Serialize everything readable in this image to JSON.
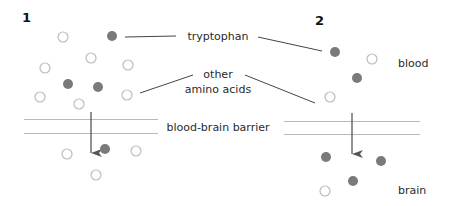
{
  "panels": [
    {
      "number": "1"
    },
    {
      "number": "2"
    }
  ],
  "labels": {
    "tryptophan": "tryptophan",
    "other_line1": "other",
    "other_line2": "amino acids",
    "barrier": "blood-brain barrier",
    "blood": "blood",
    "brain": "brain"
  },
  "colors": {
    "filled_circle": "#7a7a7a",
    "hollow_circle_stroke": "#bdbdbd",
    "barrier_line": "#b8b8b8",
    "arrow": "#555555",
    "leader_line": "#444444"
  },
  "legend": {
    "filled_circle": "tryptophan",
    "hollow_circle": "other amino acids"
  },
  "molecules": {
    "panel1_blood": [
      {
        "x": 63,
        "y": 37,
        "type": "other"
      },
      {
        "x": 112,
        "y": 36,
        "type": "tryptophan"
      },
      {
        "x": 91,
        "y": 58,
        "type": "other"
      },
      {
        "x": 128,
        "y": 65,
        "type": "other"
      },
      {
        "x": 45,
        "y": 68,
        "type": "other"
      },
      {
        "x": 68,
        "y": 84,
        "type": "tryptophan"
      },
      {
        "x": 98,
        "y": 87,
        "type": "tryptophan"
      },
      {
        "x": 127,
        "y": 95,
        "type": "other"
      },
      {
        "x": 40,
        "y": 97,
        "type": "other"
      },
      {
        "x": 79,
        "y": 104,
        "type": "other"
      }
    ],
    "panel1_brain": [
      {
        "x": 67,
        "y": 154,
        "type": "other"
      },
      {
        "x": 105,
        "y": 149,
        "type": "tryptophan"
      },
      {
        "x": 136,
        "y": 151,
        "type": "other"
      },
      {
        "x": 96,
        "y": 175,
        "type": "other"
      }
    ],
    "panel2_blood": [
      {
        "x": 335,
        "y": 52,
        "type": "tryptophan"
      },
      {
        "x": 372,
        "y": 59,
        "type": "other"
      },
      {
        "x": 357,
        "y": 78,
        "type": "tryptophan"
      },
      {
        "x": 330,
        "y": 97,
        "type": "other"
      }
    ],
    "panel2_brain": [
      {
        "x": 326,
        "y": 157,
        "type": "tryptophan"
      },
      {
        "x": 381,
        "y": 161,
        "type": "tryptophan"
      },
      {
        "x": 353,
        "y": 181,
        "type": "tryptophan"
      },
      {
        "x": 325,
        "y": 191,
        "type": "other"
      }
    ]
  }
}
